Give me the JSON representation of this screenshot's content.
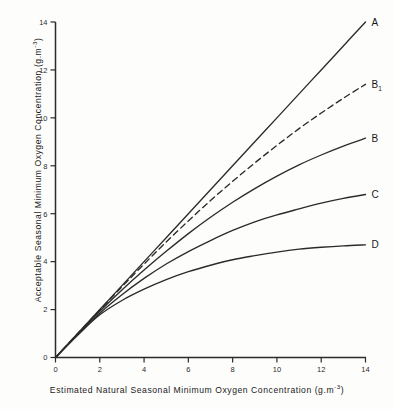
{
  "chart_data": {
    "type": "line",
    "title": "",
    "xlabel": "Estimated  Natural  Seasonal  Minimum Oxygen  Concentration  (g.m-3)",
    "ylabel": "Acceptable  Seasonal  Minimum  Oxygen  Concentration  (g.m-3)",
    "xlim": [
      0,
      14
    ],
    "ylim": [
      0,
      14
    ],
    "xticks": [
      "0",
      "2",
      "4",
      "6",
      "8",
      "10",
      "12",
      "14"
    ],
    "yticks": [
      "0",
      "2",
      "4",
      "6",
      "8",
      "10",
      "12",
      "14"
    ],
    "grid": false,
    "legend": "inline-right-end-labels",
    "x": [
      0,
      1,
      2,
      3,
      4,
      5,
      6,
      7,
      8,
      9,
      10,
      11,
      12,
      13,
      14
    ],
    "series": [
      {
        "name": "A",
        "label": "A",
        "style": "solid",
        "values": [
          0,
          1.0,
          2.0,
          3.0,
          4.0,
          5.0,
          6.0,
          7.0,
          8.0,
          9.0,
          10.0,
          11.0,
          12.0,
          13.0,
          14.0
        ]
      },
      {
        "name": "B1",
        "label": "B",
        "sublabel": "1",
        "style": "dashed",
        "values": [
          0,
          1.0,
          1.98,
          2.95,
          3.9,
          4.82,
          5.7,
          6.55,
          7.35,
          8.12,
          8.85,
          9.55,
          10.2,
          10.82,
          11.4
        ]
      },
      {
        "name": "B",
        "label": "B",
        "style": "solid",
        "values": [
          0,
          0.98,
          1.93,
          2.82,
          3.65,
          4.43,
          5.17,
          5.85,
          6.48,
          7.05,
          7.57,
          8.04,
          8.45,
          8.82,
          9.15
        ]
      },
      {
        "name": "C",
        "label": "C",
        "style": "solid",
        "values": [
          0,
          0.95,
          1.85,
          2.62,
          3.3,
          3.9,
          4.42,
          4.88,
          5.3,
          5.66,
          5.95,
          6.2,
          6.44,
          6.64,
          6.8
        ]
      },
      {
        "name": "D",
        "label": "D",
        "style": "solid",
        "values": [
          0,
          0.93,
          1.78,
          2.38,
          2.85,
          3.25,
          3.58,
          3.85,
          4.08,
          4.25,
          4.4,
          4.52,
          4.6,
          4.66,
          4.7
        ]
      }
    ]
  },
  "axes": {
    "x_title_parts": {
      "text": "Estimated  Natural  Seasonal  Minimum Oxygen  Concentration  (g.m",
      "exponent": "-3",
      "tail": ")"
    },
    "y_title_parts": {
      "text": "Acceptable  Seasonal  Minimum  Oxygen  Concentration  (g.m",
      "exponent": "-3",
      "tail": ")"
    }
  },
  "colors": {
    "background": "#fdfdfc",
    "ink": "#2b2b2b",
    "line": "#2b2b2b"
  }
}
